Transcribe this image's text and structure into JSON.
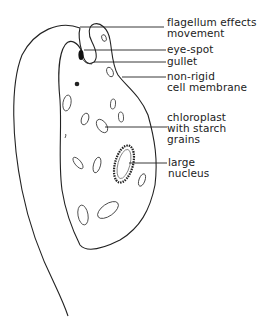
{
  "diagram": {
    "labels": [
      {
        "id": "flagellum",
        "lines": [
          "flagellum effects",
          "movement"
        ]
      },
      {
        "id": "eye-spot",
        "lines": [
          "eye-spot"
        ]
      },
      {
        "id": "gullet",
        "lines": [
          "gullet"
        ]
      },
      {
        "id": "cell-membrane",
        "lines": [
          "non-rigid",
          "cell membrane"
        ]
      },
      {
        "id": "chloroplast",
        "lines": [
          "chloroplast",
          "with starch",
          "grains"
        ]
      },
      {
        "id": "nucleus",
        "lines": [
          "large",
          "nucleus"
        ]
      }
    ]
  }
}
